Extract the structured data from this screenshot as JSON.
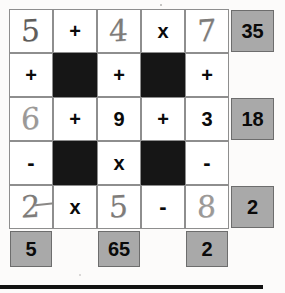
{
  "document": {
    "type": "math-puzzle-worksheet",
    "title": "Number grid puzzle",
    "gray_cell_color": "#a9a9a9",
    "black_cell_color": "#161616",
    "pencil_color": "#7e7c7a"
  },
  "grid": {
    "columns": 6,
    "rows": 6,
    "rows_data": [
      {
        "id": "row-1",
        "cells": [
          {
            "name": "cell-r1c1",
            "kind": "answer-handwritten",
            "value": "5",
            "overwritten": true
          },
          {
            "name": "cell-r1c2",
            "kind": "operator",
            "value": "+"
          },
          {
            "name": "cell-r1c3",
            "kind": "answer-handwritten",
            "value": "4"
          },
          {
            "name": "cell-r1c4",
            "kind": "operator",
            "value": "x"
          },
          {
            "name": "cell-r1c5",
            "kind": "answer-handwritten",
            "value": "7"
          },
          {
            "name": "cell-r1c6",
            "kind": "result",
            "value": "35"
          }
        ]
      },
      {
        "id": "row-2",
        "cells": [
          {
            "name": "cell-r2c1",
            "kind": "operator",
            "value": "+"
          },
          {
            "name": "cell-r2c2",
            "kind": "blocked",
            "value": ""
          },
          {
            "name": "cell-r2c3",
            "kind": "operator",
            "value": "+"
          },
          {
            "name": "cell-r2c4",
            "kind": "blocked",
            "value": ""
          },
          {
            "name": "cell-r2c5",
            "kind": "operator",
            "value": "+"
          },
          {
            "name": "cell-r2c6",
            "kind": "empty",
            "value": ""
          }
        ]
      },
      {
        "id": "row-3",
        "cells": [
          {
            "name": "cell-r3c1",
            "kind": "answer-handwritten",
            "value": "6"
          },
          {
            "name": "cell-r3c2",
            "kind": "operator",
            "value": "+"
          },
          {
            "name": "cell-r3c3",
            "kind": "given",
            "value": "9"
          },
          {
            "name": "cell-r3c4",
            "kind": "operator",
            "value": "+"
          },
          {
            "name": "cell-r3c5",
            "kind": "given",
            "value": "3"
          },
          {
            "name": "cell-r3c6",
            "kind": "result",
            "value": "18"
          }
        ]
      },
      {
        "id": "row-4",
        "cells": [
          {
            "name": "cell-r4c1",
            "kind": "operator",
            "value": "-"
          },
          {
            "name": "cell-r4c2",
            "kind": "blocked",
            "value": ""
          },
          {
            "name": "cell-r4c3",
            "kind": "operator",
            "value": "x"
          },
          {
            "name": "cell-r4c4",
            "kind": "blocked",
            "value": ""
          },
          {
            "name": "cell-r4c5",
            "kind": "operator",
            "value": "-"
          },
          {
            "name": "cell-r4c6",
            "kind": "empty",
            "value": ""
          }
        ]
      },
      {
        "id": "row-5",
        "cells": [
          {
            "name": "cell-r5c1",
            "kind": "answer-handwritten",
            "value": "2",
            "tail": true
          },
          {
            "name": "cell-r5c2",
            "kind": "operator",
            "value": "x"
          },
          {
            "name": "cell-r5c3",
            "kind": "answer-handwritten",
            "value": "5"
          },
          {
            "name": "cell-r5c4",
            "kind": "operator",
            "value": "-"
          },
          {
            "name": "cell-r5c5",
            "kind": "answer-handwritten",
            "value": "8"
          },
          {
            "name": "cell-r5c6",
            "kind": "result",
            "value": "2"
          }
        ]
      },
      {
        "id": "row-6",
        "cells": [
          {
            "name": "cell-r6c1",
            "kind": "result",
            "value": "5"
          },
          {
            "name": "cell-r6c2",
            "kind": "empty",
            "value": ""
          },
          {
            "name": "cell-r6c3",
            "kind": "result",
            "value": "65"
          },
          {
            "name": "cell-r6c4",
            "kind": "empty",
            "value": ""
          },
          {
            "name": "cell-r6c5",
            "kind": "result",
            "value": "2"
          },
          {
            "name": "cell-r6c6",
            "kind": "empty",
            "value": ""
          }
        ]
      }
    ]
  }
}
